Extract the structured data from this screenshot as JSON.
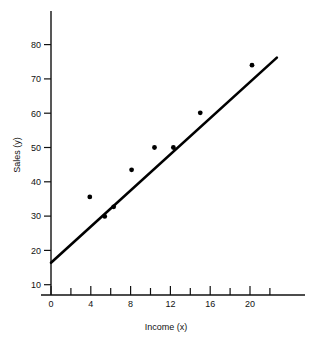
{
  "chart_data": {
    "type": "scatter",
    "title": "",
    "subtitle": "",
    "xlabel": "Income (x)",
    "ylabel": "Sales (y)",
    "xlim": [
      0,
      25.5
    ],
    "ylim": [
      0,
      88
    ],
    "grid": false,
    "legend": null,
    "xticks_major": [
      0,
      4,
      8,
      12,
      16,
      20
    ],
    "xtick_labels": [
      "0",
      "4",
      "8",
      "12",
      "16",
      "20"
    ],
    "xticks_minor": [
      2,
      6,
      10,
      14,
      18,
      22
    ],
    "yticks_major": [
      10,
      20,
      30,
      40,
      50,
      60,
      70,
      80
    ],
    "ytick_labels": [
      "10",
      "20",
      "30",
      "40",
      "50",
      "60",
      "70",
      "80"
    ],
    "points": [
      {
        "x": 3.9,
        "y": 35.6
      },
      {
        "x": 5.4,
        "y": 29.9
      },
      {
        "x": 6.3,
        "y": 32.7
      },
      {
        "x": 8.1,
        "y": 43.5
      },
      {
        "x": 10.4,
        "y": 50.0
      },
      {
        "x": 12.3,
        "y": 50.0
      },
      {
        "x": 15.0,
        "y": 60.1
      },
      {
        "x": 20.2,
        "y": 74.0
      },
      {
        "x": 4.1,
        "y": 35.6
      }
    ],
    "series": [
      {
        "name": "observations",
        "x": [
          3.9,
          5.4,
          6.3,
          8.1,
          10.4,
          12.3,
          15.0,
          20.2
        ],
        "values": [
          35.6,
          29.9,
          32.7,
          43.5,
          50.0,
          50.0,
          60.1,
          74.0
        ],
        "marker": "filled-circle",
        "color": "#000000"
      },
      {
        "name": "regression-line",
        "type": "line",
        "x": [
          0,
          22.7
        ],
        "values": [
          16.4,
          76.2
        ],
        "color": "#000000"
      }
    ],
    "annotations": []
  },
  "axes": {
    "y_axis_title": "Sales (y)",
    "x_axis_title": "Income (x)"
  },
  "colors": {
    "ink": "#111111",
    "marker": "#000000",
    "line": "#000000",
    "background": "#ffffff"
  }
}
